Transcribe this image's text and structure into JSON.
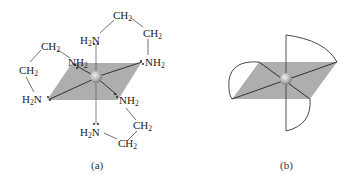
{
  "figure": {
    "panel_a": {
      "caption": "(a)",
      "center_atom": "metal-ion-sphere",
      "ligands": [
        {
          "name": "NH2 top-left",
          "text": "NH",
          "sub": "2"
        },
        {
          "name": "NH2 top-right",
          "text": "NH",
          "sub": "2"
        },
        {
          "name": "H2N top",
          "pre": "H",
          "sub": "2",
          "text": "N"
        },
        {
          "name": "H2N left",
          "pre": "H",
          "sub": "2",
          "text": "N"
        },
        {
          "name": "NH2 bottom-right",
          "text": "NH",
          "sub": "2"
        },
        {
          "name": "H2N bottom",
          "pre": "H",
          "sub": "2",
          "text": "N"
        }
      ],
      "ch2_groups": [
        {
          "text": "CH",
          "sub": "2"
        },
        {
          "text": "CH",
          "sub": "2"
        },
        {
          "text": "CH",
          "sub": "2"
        },
        {
          "text": "CH",
          "sub": "2"
        },
        {
          "text": "CH",
          "sub": "2"
        },
        {
          "text": "CH",
          "sub": "2"
        }
      ]
    },
    "panel_b": {
      "caption": "(b)"
    },
    "colors": {
      "plane": "#a9a9a9",
      "bond": "#222222",
      "sphere": "#b8b8b8",
      "text": "#222222"
    }
  }
}
